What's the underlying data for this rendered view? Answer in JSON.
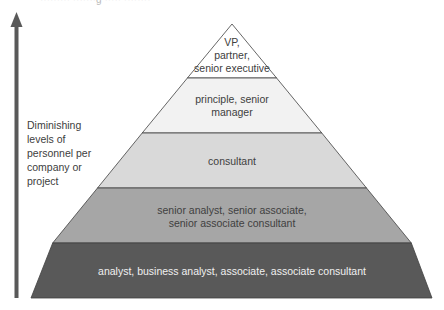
{
  "header": {
    "cut_off_caption": "········· ·······g ····· ········"
  },
  "axis": {
    "label": "Diminishing levels of personnel per company or project",
    "label_lines": [
      "Diminishing",
      "levels of",
      "personnel per",
      "company or",
      "project"
    ],
    "arrow_icon": "up-arrow",
    "arrow_color": "#595959"
  },
  "pyramid": {
    "levels": [
      {
        "label": "VP, partner, senior executive",
        "lines": [
          "VP,",
          "partner,",
          "senior executive"
        ],
        "fill": "#ffffff"
      },
      {
        "label": "principle, senior manager",
        "lines": [
          "principle, senior",
          "manager"
        ],
        "fill": "#f2f2f2"
      },
      {
        "label": "consultant",
        "lines": [
          "consultant"
        ],
        "fill": "#d9d9d9"
      },
      {
        "label": "senior analyst, senior associate, senior associate consultant",
        "lines": [
          "senior analyst, senior associate,",
          "senior associate consultant"
        ],
        "fill": "#a6a6a6"
      },
      {
        "label": "analyst, business analyst, associate, associate consultant",
        "lines": [
          "analyst, business analyst, associate, associate consultant"
        ],
        "fill": "#595959"
      }
    ],
    "outline_color": "#404040"
  }
}
